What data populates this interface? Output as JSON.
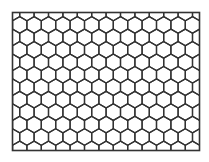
{
  "diagram": {
    "type": "hexagonal-grid",
    "orientation": "pointy-top",
    "frame": {
      "x": 12.5,
      "y": 12.5,
      "width": 187,
      "height": 138
    },
    "hex": {
      "radius": 8.3,
      "col_spacing": 14.4,
      "row_spacing": 12.45,
      "offset_x": 12.5,
      "offset_y": 12.5
    },
    "stroke_color": "#333333",
    "stroke_width": 1.3,
    "background": "#ffffff"
  }
}
